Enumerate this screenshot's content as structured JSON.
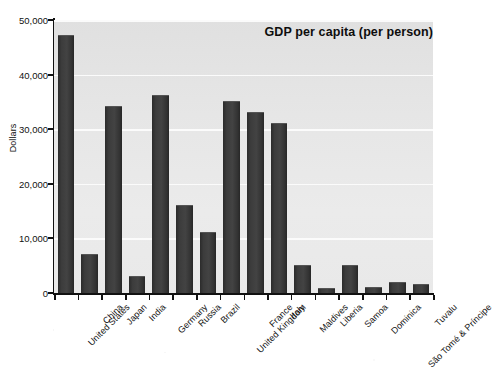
{
  "chart_data": {
    "type": "bar",
    "title": "GDP per capita (per person)",
    "xlabel": "",
    "ylabel": "Dollars",
    "ylim": [
      0,
      50000
    ],
    "yticks": [
      0,
      10000,
      20000,
      30000,
      40000,
      50000
    ],
    "ytick_labels": [
      "0",
      "10,000",
      "20,000",
      "30,000",
      "40,000",
      "50,000"
    ],
    "grid": true,
    "legend": "none",
    "bar_color": "#3a3a3a",
    "plot_background": "#e6e6e6",
    "gridline_color": "#fbfbfb",
    "categories": [
      "United States",
      "China",
      "Japan",
      "India",
      "Germany",
      "Russia",
      "Brazil",
      "United Kingdom",
      "France",
      "Italy",
      "Maldives",
      "Liberia",
      "Samoa",
      "Dominica",
      "São Tomé & Príncipe",
      "Tuvalu"
    ],
    "values": [
      47000,
      7000,
      34000,
      2900,
      36000,
      16000,
      11000,
      35000,
      33000,
      31000,
      5000,
      800,
      5000,
      1000,
      1800,
      1400
    ]
  }
}
